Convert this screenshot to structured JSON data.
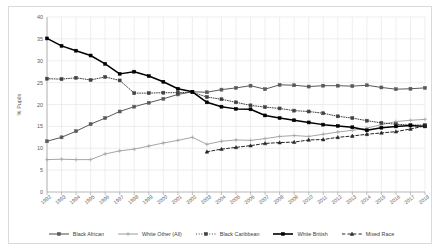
{
  "chart_data": {
    "type": "line",
    "title": "",
    "xlabel": "",
    "ylabel": "% Pupils",
    "ylim": [
      0,
      40
    ],
    "ytick_step": 5,
    "yticks": [
      0,
      5,
      10,
      15,
      20,
      25,
      30,
      35,
      40
    ],
    "grid": true,
    "legend_position": "bottom",
    "categories": [
      "1992",
      "1993",
      "1994",
      "1995",
      "1996",
      "1997",
      "1998",
      "1999",
      "2000",
      "2001",
      "2002",
      "2003",
      "2004",
      "2005",
      "2006",
      "2007",
      "2008",
      "2009",
      "2010",
      "2011",
      "2012",
      "2013",
      "2014",
      "2015",
      "2016",
      "2017",
      "2018"
    ],
    "series": [
      {
        "name": "Black African",
        "color": "#595959",
        "line_style": "solid",
        "marker": "square",
        "values": [
          11.6,
          12.5,
          13.9,
          15.5,
          16.9,
          18.4,
          19.5,
          20.4,
          21.3,
          22.3,
          22.9,
          22.8,
          23.4,
          23.8,
          24.3,
          23.5,
          24.5,
          24.4,
          24.1,
          24.3,
          24.3,
          24.2,
          24.4,
          23.9,
          23.5,
          23.6,
          23.8
        ]
      },
      {
        "name": "White Other (All)",
        "color": "#a6a6a6",
        "line_style": "solid",
        "marker": "plus",
        "values": [
          7.4,
          7.5,
          7.4,
          7.4,
          8.7,
          9.4,
          9.8,
          10.5,
          11.2,
          11.8,
          12.5,
          10.9,
          11.6,
          11.9,
          11.8,
          12.2,
          12.7,
          12.9,
          12.7,
          13.2,
          13.7,
          14.1,
          14.6,
          15.4,
          16.1,
          16.4,
          16.6
        ]
      },
      {
        "name": "Black Caribbean",
        "color": "#404040",
        "line_style": "dotted",
        "marker": "square",
        "values": [
          25.9,
          25.8,
          26.1,
          25.6,
          26.3,
          25.5,
          22.6,
          22.6,
          22.7,
          22.7,
          22.8,
          21.7,
          21.2,
          20.5,
          19.8,
          19.4,
          19.1,
          18.6,
          18.4,
          18.0,
          17.3,
          16.9,
          16.3,
          15.8,
          15.5,
          15.3,
          15.3
        ]
      },
      {
        "name": "White British",
        "color": "#000000",
        "line_style": "solid",
        "marker": "square",
        "values": [
          35.1,
          33.4,
          32.3,
          31.2,
          29.3,
          27.0,
          27.5,
          26.5,
          25.2,
          23.6,
          22.9,
          20.5,
          19.5,
          19.0,
          18.9,
          17.5,
          16.9,
          16.4,
          15.9,
          15.4,
          15.1,
          14.8,
          14.1,
          14.7,
          15.0,
          15.2,
          15.0
        ]
      },
      {
        "name": "Mixed Race",
        "color": "#262626",
        "line_style": "dashed",
        "marker": "triangle",
        "values": [
          null,
          null,
          null,
          null,
          null,
          null,
          null,
          null,
          null,
          null,
          null,
          9.2,
          9.8,
          10.2,
          10.6,
          11.1,
          11.3,
          11.4,
          11.9,
          12.0,
          12.5,
          12.8,
          13.2,
          13.5,
          13.8,
          14.4,
          15.1
        ]
      }
    ]
  }
}
